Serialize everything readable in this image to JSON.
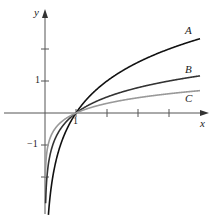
{
  "chart_data": {
    "type": "line",
    "title": "",
    "xlabel": "x",
    "ylabel": "y",
    "x_ticks": [
      1,
      2,
      3,
      4
    ],
    "x_tick_labels": [
      "1"
    ],
    "y_ticks": [
      -2,
      -1,
      1,
      2
    ],
    "y_tick_labels": [
      "-1",
      "1"
    ],
    "xlim": [
      -1.4,
      5.3
    ],
    "ylim": [
      -3.2,
      3.4
    ],
    "grid": false,
    "series": [
      {
        "name": "A",
        "function": "log2(x)",
        "color": "#111111",
        "x": [
          0.1,
          0.25,
          0.5,
          1,
          2,
          3,
          4,
          5
        ],
        "values": [
          -3.32,
          -2,
          -1,
          0,
          1,
          1.58,
          2,
          2.32
        ]
      },
      {
        "name": "B",
        "function": "log4(x)",
        "color": "#333333",
        "x": [
          0.1,
          0.25,
          0.5,
          1,
          2,
          3,
          4,
          5
        ],
        "values": [
          -1.66,
          -1,
          -0.5,
          0,
          0.5,
          0.79,
          1,
          1.16
        ]
      },
      {
        "name": "C",
        "function": "log10(x)",
        "color": "#999999",
        "x": [
          0.1,
          0.25,
          0.5,
          1,
          2,
          3,
          4,
          5
        ],
        "values": [
          -1,
          -0.6,
          -0.3,
          0,
          0.3,
          0.48,
          0.6,
          0.7
        ]
      }
    ],
    "annotations": [
      "A",
      "B",
      "C"
    ]
  }
}
